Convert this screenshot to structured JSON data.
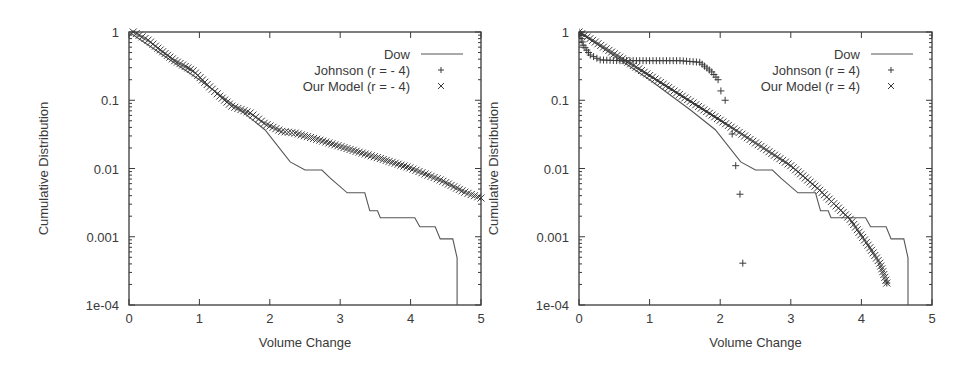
{
  "chart_data": [
    {
      "type": "line",
      "title": "",
      "xlabel": "Volume Change",
      "ylabel": "Cumulative Distribution",
      "xlim": [
        0,
        5
      ],
      "ylim": [
        0.0001,
        1
      ],
      "yscale": "log",
      "x_ticks": [
        "0",
        "1",
        "2",
        "3",
        "4",
        "5"
      ],
      "y_ticks": [
        "1e-04",
        "0.001",
        "0.01",
        "0.1",
        "1"
      ],
      "grid": false,
      "legend_position": "top-right",
      "series": [
        {
          "name": "Dow",
          "style": "line",
          "points": [
            [
              0,
              1
            ],
            [
              1.0,
              0.2
            ],
            [
              1.58,
              0.072
            ],
            [
              1.93,
              0.037
            ],
            [
              2.29,
              0.0125
            ],
            [
              2.5,
              0.0095
            ],
            [
              2.74,
              0.0095
            ],
            [
              2.86,
              0.0072
            ],
            [
              3.1,
              0.0044
            ],
            [
              3.35,
              0.0044
            ],
            [
              3.42,
              0.0024
            ],
            [
              3.53,
              0.0024
            ],
            [
              3.57,
              0.0019
            ],
            [
              4.06,
              0.0019
            ],
            [
              4.13,
              0.0014
            ],
            [
              4.35,
              0.0014
            ],
            [
              4.42,
              0.00093
            ],
            [
              4.6,
              0.00093
            ],
            [
              4.66,
              0.00049
            ],
            [
              4.66,
              0.0001
            ]
          ]
        },
        {
          "name": "Johnson (r = - 4)",
          "style": "plus",
          "points": []
        },
        {
          "name": "Our Model (r = - 4)",
          "style": "cross",
          "points": [
            [
              0.06,
              1
            ],
            [
              0.27,
              0.76
            ],
            [
              0.41,
              0.58
            ],
            [
              0.65,
              0.38
            ],
            [
              0.91,
              0.27
            ],
            [
              1.11,
              0.17
            ],
            [
              1.29,
              0.115
            ],
            [
              1.46,
              0.082
            ],
            [
              1.72,
              0.065
            ],
            [
              1.92,
              0.046
            ],
            [
              2.17,
              0.035
            ],
            [
              2.36,
              0.033
            ],
            [
              2.71,
              0.026
            ],
            [
              3.14,
              0.019
            ],
            [
              3.57,
              0.014
            ],
            [
              3.99,
              0.0102
            ],
            [
              4.42,
              0.0068
            ],
            [
              4.77,
              0.0045
            ],
            [
              5.0,
              0.0037
            ]
          ]
        }
      ]
    },
    {
      "type": "line",
      "title": "",
      "xlabel": "Volume Change",
      "ylabel": "Cumulative Distribution",
      "xlim": [
        0,
        5
      ],
      "ylim": [
        0.0001,
        1
      ],
      "yscale": "log",
      "x_ticks": [
        "0",
        "1",
        "2",
        "3",
        "4",
        "5"
      ],
      "y_ticks": [
        "1e-04",
        "0.001",
        "0.01",
        "0.1",
        "1"
      ],
      "grid": false,
      "legend_position": "top-right",
      "series": [
        {
          "name": "Dow",
          "style": "line",
          "points": [
            [
              0,
              1
            ],
            [
              1.0,
              0.2
            ],
            [
              1.58,
              0.072
            ],
            [
              1.93,
              0.037
            ],
            [
              2.29,
              0.0125
            ],
            [
              2.5,
              0.0095
            ],
            [
              2.74,
              0.0095
            ],
            [
              2.86,
              0.0072
            ],
            [
              3.1,
              0.0044
            ],
            [
              3.35,
              0.0044
            ],
            [
              3.42,
              0.0024
            ],
            [
              3.53,
              0.0024
            ],
            [
              3.57,
              0.0019
            ],
            [
              4.06,
              0.0019
            ],
            [
              4.13,
              0.0014
            ],
            [
              4.35,
              0.0014
            ],
            [
              4.42,
              0.00093
            ],
            [
              4.6,
              0.00093
            ],
            [
              4.66,
              0.00049
            ],
            [
              4.66,
              0.0001
            ]
          ]
        },
        {
          "name": "Johnson (r = 4)",
          "style": "plus",
          "points": [
            [
              0,
              1
            ],
            [
              0.06,
              0.64
            ],
            [
              0.16,
              0.46
            ],
            [
              0.3,
              0.39
            ],
            [
              0.58,
              0.38
            ],
            [
              1.0,
              0.38
            ],
            [
              1.43,
              0.38
            ],
            [
              1.71,
              0.36
            ],
            [
              1.88,
              0.26
            ],
            [
              1.97,
              0.2
            ],
            [
              2.01,
              0.137
            ],
            [
              2.07,
              0.1
            ],
            [
              2.17,
              0.032
            ],
            [
              2.22,
              0.011
            ],
            [
              2.28,
              0.0042
            ],
            [
              2.32,
              0.00041
            ]
          ]
        },
        {
          "name": "Our Model (r = 4)",
          "style": "cross",
          "points": [
            [
              0,
              1
            ],
            [
              1.0,
              0.23
            ],
            [
              2.0,
              0.051
            ],
            [
              3.0,
              0.011
            ],
            [
              3.41,
              0.0048
            ],
            [
              3.84,
              0.0018
            ],
            [
              4.12,
              0.00069
            ],
            [
              4.26,
              0.00041
            ],
            [
              4.36,
              0.00021
            ]
          ]
        }
      ]
    }
  ]
}
